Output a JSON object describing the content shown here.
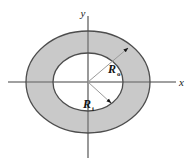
{
  "figure": {
    "name": "annulus-cross-section",
    "background_color": "#ffffff"
  },
  "axes": {
    "x_label": "x",
    "y_label": "y",
    "line_color": "#808080",
    "origin": {
      "x": 88,
      "y": 82
    }
  },
  "shapes": {
    "outer_circle": {
      "name": "outer-circle",
      "cx": 88,
      "cy": 82,
      "rx": 62,
      "ry": 51,
      "fill_color": "#c9c9c9",
      "stroke_color": "#4d4d4d"
    },
    "inner_circle": {
      "name": "inner-circle",
      "cx": 88,
      "cy": 82,
      "rx": 35,
      "ry": 29,
      "fill_color": "#ffffff",
      "stroke_color": "#4d4d4d"
    }
  },
  "callouts": [
    {
      "name": "outer-radius-callout",
      "label": "R",
      "subscript": "o",
      "meaning": "outer radius",
      "leader_from": {
        "x": 88,
        "y": 82
      },
      "leader_to": {
        "x": 129,
        "y": 47
      },
      "label_at": {
        "x": 112,
        "y": 72
      }
    },
    {
      "name": "inner-radius-callout",
      "label": "R",
      "subscript": "i",
      "meaning": "inner radius",
      "leader_from": {
        "x": 88,
        "y": 82
      },
      "leader_to": {
        "x": 112,
        "y": 104
      },
      "label_at": {
        "x": 88,
        "y": 107
      }
    }
  ]
}
